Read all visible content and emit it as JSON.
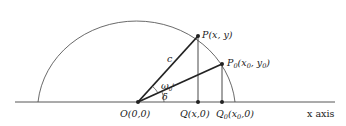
{
  "diagram": {
    "type": "geometry",
    "colors": {
      "line": "#333333",
      "background": "#ffffff"
    },
    "points": {
      "origin": {
        "label": "O(0,0)"
      },
      "P": {
        "label": "P(x, y)"
      },
      "P0": {
        "label_main": "P",
        "label_sub": "0",
        "label_rest": "(x",
        "label_sub2": "0",
        "label_mid": ", y",
        "label_sub3": "0",
        "label_end": ")"
      },
      "Q": {
        "label": "Q(x,0)"
      },
      "Q0": {
        "label_main": "Q",
        "label_sub": "0",
        "label_rest": "(x",
        "label_sub2": "0",
        "label_end": ",0)"
      }
    },
    "segment_labels": {
      "radius": "c"
    },
    "angles": {
      "omega": {
        "main": "ω",
        "sub": "0",
        "sup": "t"
      },
      "delta": "δ"
    },
    "axis": {
      "label": "x axis"
    }
  }
}
